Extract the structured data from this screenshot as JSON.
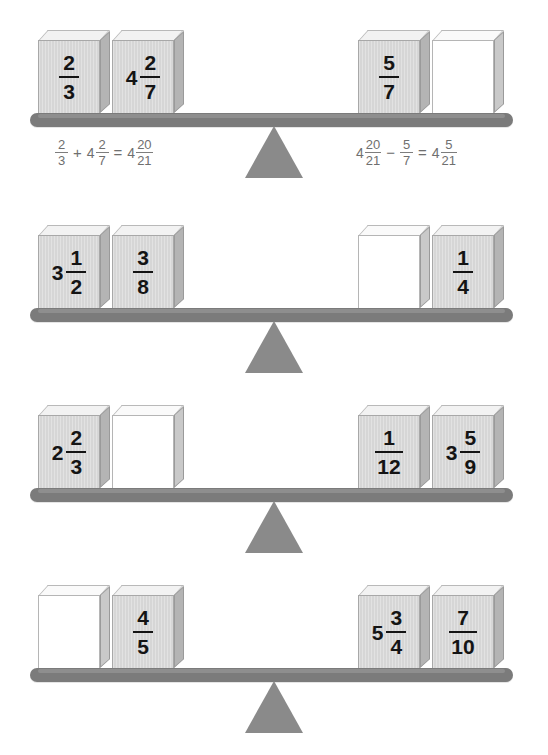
{
  "page": {
    "colors": {
      "beam": "#7b7b7b",
      "fulcrum": "#8a8a8a",
      "block_front": "#d6d6d6",
      "block_top": "#f2f2f2",
      "block_side": "#b4b4b4",
      "blank_front": "#ffffff",
      "text": "#141414",
      "equation_text": "#6f6f6f"
    }
  },
  "rows": [
    {
      "left_blocks": [
        {
          "blank": false,
          "whole": "",
          "num": "2",
          "den": "3"
        },
        {
          "blank": false,
          "whole": "4",
          "num": "2",
          "den": "7"
        }
      ],
      "right_blocks": [
        {
          "blank": false,
          "whole": "",
          "num": "5",
          "den": "7"
        },
        {
          "blank": true,
          "whole": "",
          "num": "",
          "den": ""
        }
      ],
      "left_equation": {
        "terms": [
          {
            "type": "frac",
            "whole": "",
            "num": "2",
            "den": "3"
          },
          {
            "type": "op",
            "text": "+"
          },
          {
            "type": "frac",
            "whole": "4",
            "num": "2",
            "den": "7"
          },
          {
            "type": "op",
            "text": "="
          },
          {
            "type": "frac",
            "whole": "4",
            "num": "20",
            "den": "21"
          }
        ]
      },
      "right_equation": {
        "terms": [
          {
            "type": "frac",
            "whole": "4",
            "num": "20",
            "den": "21"
          },
          {
            "type": "op",
            "text": "−"
          },
          {
            "type": "frac",
            "whole": "",
            "num": "5",
            "den": "7"
          },
          {
            "type": "op",
            "text": "="
          },
          {
            "type": "frac",
            "whole": "4",
            "num": "5",
            "den": "21"
          }
        ]
      }
    },
    {
      "left_blocks": [
        {
          "blank": false,
          "whole": "3",
          "num": "1",
          "den": "2"
        },
        {
          "blank": false,
          "whole": "",
          "num": "3",
          "den": "8"
        }
      ],
      "right_blocks": [
        {
          "blank": true,
          "whole": "",
          "num": "",
          "den": ""
        },
        {
          "blank": false,
          "whole": "",
          "num": "1",
          "den": "4"
        }
      ],
      "left_equation": null,
      "right_equation": null
    },
    {
      "left_blocks": [
        {
          "blank": false,
          "whole": "2",
          "num": "2",
          "den": "3"
        },
        {
          "blank": true,
          "whole": "",
          "num": "",
          "den": ""
        }
      ],
      "right_blocks": [
        {
          "blank": false,
          "whole": "",
          "num": "1",
          "den": "12"
        },
        {
          "blank": false,
          "whole": "3",
          "num": "5",
          "den": "9"
        }
      ],
      "left_equation": null,
      "right_equation": null
    },
    {
      "left_blocks": [
        {
          "blank": true,
          "whole": "",
          "num": "",
          "den": ""
        },
        {
          "blank": false,
          "whole": "",
          "num": "4",
          "den": "5"
        }
      ],
      "right_blocks": [
        {
          "blank": false,
          "whole": "5",
          "num": "3",
          "den": "4"
        },
        {
          "blank": false,
          "whole": "",
          "num": "7",
          "den": "10"
        }
      ],
      "left_equation": null,
      "right_equation": null
    }
  ]
}
